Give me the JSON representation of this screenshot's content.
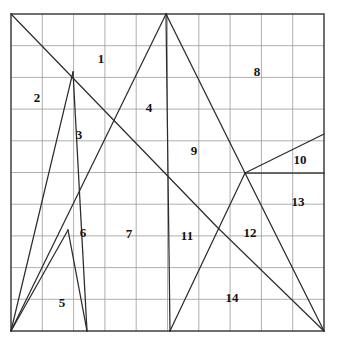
{
  "figure": {
    "type": "geometric-dissection",
    "grid": {
      "columns": 10,
      "rows": 10,
      "x0": 11,
      "y0": 14,
      "x1": 324,
      "y1": 331,
      "grid_color": "#9a9a9a",
      "border_color": "#4a4a4a",
      "line_color": "#2b2b2b",
      "background": "#ffffff"
    },
    "vertices": {
      "TL": [
        11,
        14
      ],
      "APEX": [
        166,
        14
      ],
      "TR": [
        324,
        14
      ],
      "BL": [
        11,
        331
      ],
      "B_LEFT": [
        87,
        331
      ],
      "B_MID": [
        170,
        331
      ],
      "BR": [
        324,
        331
      ],
      "R_UPPER": [
        324,
        134
      ],
      "R_MID": [
        324,
        173
      ],
      "J_HUB": [
        245,
        173
      ],
      "J_CROSS": [
        219,
        229
      ],
      "J_UPPER_LEFT": [
        118,
        120
      ],
      "J_LOWER_LEFT": [
        68,
        230
      ],
      "P_LEFT": [
        73,
        72
      ]
    },
    "segments": [
      {
        "name": "tl-to-bottom-right-diagonal",
        "from": [
          11,
          14
        ],
        "to": [
          219,
          229
        ]
      },
      {
        "name": "apex-to-bottom-left-diagonal",
        "from": [
          166,
          14
        ],
        "to": [
          11,
          331
        ]
      },
      {
        "name": "apex-vertical",
        "from": [
          166,
          14
        ],
        "to": [
          170,
          331
        ]
      },
      {
        "name": "apex-to-hub",
        "from": [
          166,
          14
        ],
        "to": [
          245,
          173
        ]
      },
      {
        "name": "hub-to-bottom-right",
        "from": [
          245,
          173
        ],
        "to": [
          324,
          331
        ]
      },
      {
        "name": "hub-to-right-upper",
        "from": [
          245,
          173
        ],
        "to": [
          324,
          134
        ]
      },
      {
        "name": "hub-horizontal-right",
        "from": [
          245,
          173
        ],
        "to": [
          324,
          173
        ]
      },
      {
        "name": "hub-to-bottom-mid",
        "from": [
          245,
          173
        ],
        "to": [
          170,
          331
        ]
      },
      {
        "name": "cross-to-bottom-right",
        "from": [
          219,
          229
        ],
        "to": [
          324,
          331
        ]
      },
      {
        "name": "bottomleft-to-upperleft-peak",
        "from": [
          11,
          331
        ],
        "to": [
          73,
          72
        ]
      },
      {
        "name": "upperleft-peak-to-bottom",
        "from": [
          73,
          72
        ],
        "to": [
          87,
          331
        ]
      },
      {
        "name": "bottomleft-to-lowerleft-junction",
        "from": [
          11,
          331
        ],
        "to": [
          68,
          230
        ]
      },
      {
        "name": "lowerleft-junction-to-bottom",
        "from": [
          68,
          230
        ],
        "to": [
          87,
          331
        ]
      }
    ],
    "region_labels": [
      {
        "id": "1",
        "text": "1",
        "x": 101,
        "y": 58
      },
      {
        "id": "2",
        "text": "2",
        "x": 37,
        "y": 97
      },
      {
        "id": "3",
        "text": "3",
        "x": 79,
        "y": 134
      },
      {
        "id": "4",
        "text": "4",
        "x": 149,
        "y": 107
      },
      {
        "id": "5",
        "text": "5",
        "x": 62,
        "y": 302
      },
      {
        "id": "6",
        "text": "6",
        "x": 83,
        "y": 232
      },
      {
        "id": "7",
        "text": "7",
        "x": 129,
        "y": 233
      },
      {
        "id": "8",
        "text": "8",
        "x": 257,
        "y": 71
      },
      {
        "id": "9",
        "text": "9",
        "x": 194,
        "y": 150
      },
      {
        "id": "10",
        "text": "10",
        "x": 300,
        "y": 159
      },
      {
        "id": "11",
        "text": "11",
        "x": 187,
        "y": 235
      },
      {
        "id": "12",
        "text": "12",
        "x": 250,
        "y": 232
      },
      {
        "id": "13",
        "text": "13",
        "x": 298,
        "y": 201
      },
      {
        "id": "14",
        "text": "14",
        "x": 232,
        "y": 297
      }
    ]
  }
}
